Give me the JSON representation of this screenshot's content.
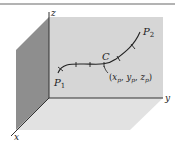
{
  "diagram": {
    "axes": {
      "z_label": "z",
      "y_label": "y",
      "x_label": "x"
    },
    "curve": {
      "name": "C",
      "start_point": {
        "base": "P",
        "sub": "1"
      },
      "end_point": {
        "base": "P",
        "sub": "2"
      },
      "point_label": {
        "open": "(",
        "x": "x",
        "xs": "p",
        "sep1": ", ",
        "y": "y",
        "ys": "p",
        "sep2": ", ",
        "z": "z",
        "zs": "p",
        "close": ")"
      }
    },
    "colors": {
      "back_wall": "#d4d4d4",
      "left_wall": "#8c8c8c",
      "floor": "#e0e0e0",
      "line": "#333333",
      "rule": "#9a9a9a"
    }
  }
}
